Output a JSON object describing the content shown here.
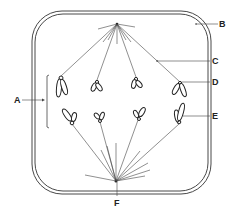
{
  "diagram": {
    "labels": {
      "A": "A",
      "B": "B",
      "C": "C",
      "D": "D",
      "E": "E",
      "F": "F"
    },
    "colors": {
      "line": "#444444",
      "outline": "#333333",
      "background": "#ffffff"
    }
  }
}
